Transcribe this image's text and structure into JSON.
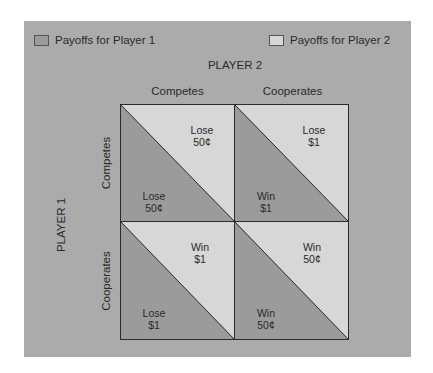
{
  "colors": {
    "background": "#ffffff",
    "panel": "#ababab",
    "player1_payoff": "#9b9b9b",
    "player2_payoff": "#d7d7d7",
    "line": "#2b2b2b"
  },
  "legend": {
    "player1": "Payoffs for Player 1",
    "player2": "Payoffs for Player 2"
  },
  "player2": {
    "title": "PLAYER 2",
    "strategies": [
      "Competes",
      "Cooperates"
    ]
  },
  "player1": {
    "title": "PLAYER 1",
    "strategies": [
      "Competes",
      "Cooperates"
    ]
  },
  "matrix": [
    [
      {
        "p1_line1": "Lose",
        "p1_line2": "50¢",
        "p2_line1": "Lose",
        "p2_line2": "50¢"
      },
      {
        "p1_line1": "Win",
        "p1_line2": "$1",
        "p2_line1": "Lose",
        "p2_line2": "$1"
      }
    ],
    [
      {
        "p1_line1": "Lose",
        "p1_line2": "$1",
        "p2_line1": "Win",
        "p2_line2": "$1"
      },
      {
        "p1_line1": "Win",
        "p1_line2": "50¢",
        "p2_line1": "Win",
        "p2_line2": "50¢"
      }
    ]
  ]
}
